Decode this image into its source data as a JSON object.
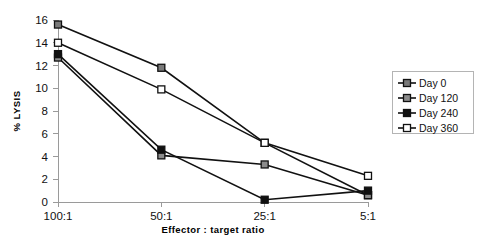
{
  "chart_data": {
    "type": "line",
    "title": "",
    "xlabel": "Effector  :  target  ratio",
    "ylabel": "% LYSIS",
    "categories": [
      "100:1",
      "50:1",
      "25:1",
      "5:1"
    ],
    "ylim": [
      0,
      16
    ],
    "yticks": [
      0,
      2,
      4,
      6,
      8,
      10,
      12,
      14,
      16
    ],
    "ytick_labels": [
      "0",
      "2",
      "4",
      "6",
      "8",
      "10",
      "12",
      "14",
      "16"
    ],
    "grid": false,
    "legend_position": "right",
    "series": [
      {
        "name": "Day 0",
        "values": [
          15.6,
          11.8,
          5.2,
          0.6
        ],
        "marker": "filled-gray-square",
        "marker_fill": "#7a7a7a",
        "marker_stroke": "#111111"
      },
      {
        "name": "Day 120",
        "values": [
          12.7,
          4.1,
          3.3,
          0.6
        ],
        "marker": "filled-gray-square",
        "marker_fill": "#8c8c8c",
        "marker_stroke": "#111111"
      },
      {
        "name": "Day 240",
        "values": [
          13.0,
          4.6,
          0.2,
          1.0
        ],
        "marker": "filled-black-square",
        "marker_fill": "#111111",
        "marker_stroke": "#111111"
      },
      {
        "name": "Day 360",
        "values": [
          14.0,
          9.9,
          5.2,
          2.3
        ],
        "marker": "open-white-square",
        "marker_fill": "#ffffff",
        "marker_stroke": "#111111"
      }
    ]
  },
  "axes": {
    "y_axis_title": "% LYSIS",
    "x_axis_title": "Effector  :  target  ratio"
  },
  "legend": {
    "entries": [
      {
        "label": "Day 0"
      },
      {
        "label": "Day 120"
      },
      {
        "label": "Day 240"
      },
      {
        "label": "Day 360"
      }
    ]
  },
  "colors": {
    "axis": "#9a9a9a",
    "line": "#111111",
    "legend_border": "#b4b4b4",
    "background": "#ffffff"
  }
}
